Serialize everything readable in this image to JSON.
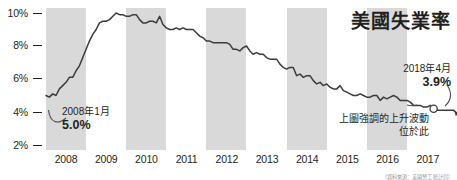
{
  "chart_data": {
    "type": "line",
    "title": "美國失業率",
    "xlabel": "",
    "ylabel": "",
    "ylim": [
      2,
      10.6
    ],
    "xlim": [
      "2008-01",
      "2018-05"
    ],
    "grid": false,
    "legend": "none",
    "y_ticks": [
      "10%",
      "8%",
      "6%",
      "4%",
      "2%"
    ],
    "y_tick_values": [
      10,
      8,
      6,
      4,
      2
    ],
    "x_ticks": [
      "2008",
      "2009",
      "2010",
      "2011",
      "2012",
      "2013",
      "2014",
      "2015",
      "2016",
      "2017"
    ],
    "shaded_year_bands": [
      "2008",
      "2010",
      "2012",
      "2014",
      "2016"
    ],
    "series": [
      {
        "name": "美國失業率",
        "color": "#3b3b3b",
        "units": "percent",
        "frequency": "monthly",
        "x": [
          "2008-01",
          "2008-02",
          "2008-03",
          "2008-04",
          "2008-05",
          "2008-06",
          "2008-07",
          "2008-08",
          "2008-09",
          "2008-10",
          "2008-11",
          "2008-12",
          "2009-01",
          "2009-02",
          "2009-03",
          "2009-04",
          "2009-05",
          "2009-06",
          "2009-07",
          "2009-08",
          "2009-09",
          "2009-10",
          "2009-11",
          "2009-12",
          "2010-01",
          "2010-02",
          "2010-03",
          "2010-04",
          "2010-05",
          "2010-06",
          "2010-07",
          "2010-08",
          "2010-09",
          "2010-10",
          "2010-11",
          "2010-12",
          "2011-01",
          "2011-02",
          "2011-03",
          "2011-04",
          "2011-05",
          "2011-06",
          "2011-07",
          "2011-08",
          "2011-09",
          "2011-10",
          "2011-11",
          "2011-12",
          "2012-01",
          "2012-02",
          "2012-03",
          "2012-04",
          "2012-05",
          "2012-06",
          "2012-07",
          "2012-08",
          "2012-09",
          "2012-10",
          "2012-11",
          "2012-12",
          "2013-01",
          "2013-02",
          "2013-03",
          "2013-04",
          "2013-05",
          "2013-06",
          "2013-07",
          "2013-08",
          "2013-09",
          "2013-10",
          "2013-11",
          "2013-12",
          "2014-01",
          "2014-02",
          "2014-03",
          "2014-04",
          "2014-05",
          "2014-06",
          "2014-07",
          "2014-08",
          "2014-09",
          "2014-10",
          "2014-11",
          "2014-12",
          "2015-01",
          "2015-02",
          "2015-03",
          "2015-04",
          "2015-05",
          "2015-06",
          "2015-07",
          "2015-08",
          "2015-09",
          "2015-10",
          "2015-11",
          "2015-12",
          "2016-01",
          "2016-02",
          "2016-03",
          "2016-04",
          "2016-05",
          "2016-06",
          "2016-07",
          "2016-08",
          "2016-09",
          "2016-10",
          "2016-11",
          "2016-12",
          "2017-01",
          "2017-02",
          "2017-03",
          "2017-04",
          "2017-05",
          "2017-06",
          "2017-07",
          "2017-08",
          "2017-09",
          "2017-10",
          "2017-11",
          "2017-12",
          "2018-01",
          "2018-02",
          "2018-03",
          "2018-04"
        ],
        "values": [
          5.0,
          4.9,
          5.1,
          5.0,
          5.4,
          5.6,
          5.8,
          6.1,
          6.1,
          6.5,
          6.8,
          7.3,
          7.8,
          8.3,
          8.7,
          9.0,
          9.4,
          9.5,
          9.5,
          9.6,
          9.8,
          10.0,
          9.9,
          9.9,
          9.8,
          9.8,
          9.9,
          9.9,
          9.6,
          9.4,
          9.4,
          9.5,
          9.5,
          9.4,
          9.8,
          9.3,
          9.1,
          9.0,
          9.0,
          9.1,
          9.0,
          9.1,
          9.0,
          9.0,
          9.0,
          8.8,
          8.6,
          8.5,
          8.3,
          8.3,
          8.2,
          8.2,
          8.2,
          8.2,
          8.2,
          8.1,
          7.8,
          7.8,
          7.7,
          7.9,
          8.0,
          7.7,
          7.5,
          7.6,
          7.5,
          7.5,
          7.3,
          7.2,
          7.2,
          7.2,
          6.9,
          6.7,
          6.6,
          6.7,
          6.7,
          6.2,
          6.3,
          6.1,
          6.2,
          6.2,
          5.9,
          5.7,
          5.8,
          5.6,
          5.7,
          5.5,
          5.4,
          5.4,
          5.6,
          5.3,
          5.2,
          5.1,
          5.0,
          5.0,
          5.1,
          5.0,
          4.9,
          4.9,
          5.0,
          5.0,
          4.7,
          4.9,
          4.8,
          4.9,
          5.0,
          4.9,
          4.7,
          4.7,
          4.7,
          4.6,
          4.4,
          4.4,
          4.4,
          4.3,
          4.3,
          4.4,
          4.2,
          4.1,
          4.1,
          4.1,
          4.1,
          4.1,
          4.1,
          3.9
        ]
      }
    ],
    "annotations": [
      {
        "id": "start-point",
        "date_label": "2008年1月",
        "value_label": "5.0%",
        "value": 5.0,
        "leader": "curved"
      },
      {
        "id": "end-point",
        "date_label": "2018年4月",
        "value_label": "3.9%",
        "value": 3.9,
        "leader": "curved"
      },
      {
        "id": "highlight-note",
        "line1": "上圖強調的上升波動",
        "line2": "位於此",
        "marker": "open-circle"
      }
    ]
  },
  "footnote": {
    "text": "（資料來源：美國勞工統計局）"
  },
  "colors": {
    "line": "#3b3b3b",
    "band": "#d9d9d9",
    "text": "#231f20",
    "background": "#ffffff"
  }
}
